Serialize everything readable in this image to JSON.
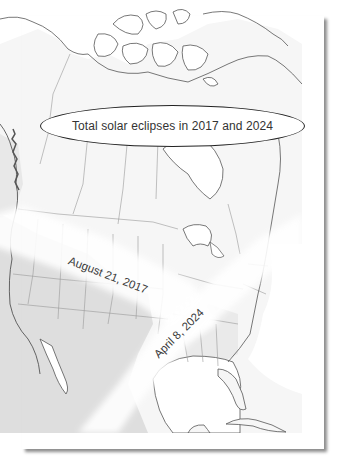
{
  "map": {
    "title": "Total solar eclipses in 2017 and 2024",
    "eclipse_paths": [
      {
        "label": "August 21, 2017",
        "direction": "northwest-to-southeast"
      },
      {
        "label": "April 8, 2024",
        "direction": "southwest-to-northeast"
      }
    ],
    "colors": {
      "land_shaded": "#dcdcdc",
      "land_light": "#f4f4f4",
      "path_band": "#ffffff",
      "outline": "#555555",
      "border": "#999999"
    }
  }
}
